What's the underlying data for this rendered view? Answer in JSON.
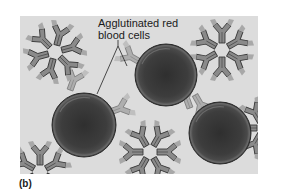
{
  "figure": {
    "panel_label": "(b)",
    "callout": {
      "line1": "Agglutinated red",
      "line2": "blood cells",
      "full_text": "Agglutinated red blood cells"
    },
    "colors": {
      "background_page": "#ffffff",
      "panel_background": "#dcdcdc",
      "antibody_body": "#8a8a8a",
      "antibody_outline": "#3a3a3a",
      "antibody_tip": "#a8a8a8",
      "rbc_fill": "#3d3d3d",
      "rbc_rim": "#555555",
      "leader_line": "#222222"
    },
    "red_blood_cells": [
      {
        "name": "left",
        "cx": 84,
        "cy": 125,
        "r": 32
      },
      {
        "name": "top-middle",
        "cx": 166,
        "cy": 75,
        "r": 31
      },
      {
        "name": "right",
        "cx": 220,
        "cy": 133,
        "r": 31
      }
    ],
    "antibody_clusters": [
      {
        "name": "top-left",
        "cx": 55,
        "cy": 52
      },
      {
        "name": "top-right",
        "cx": 222,
        "cy": 50
      },
      {
        "name": "bottom-middle",
        "cx": 150,
        "cy": 152
      },
      {
        "name": "bottom-left",
        "cx": 40,
        "cy": 170
      },
      {
        "name": "right-edge",
        "cx": 262,
        "cy": 128
      }
    ]
  }
}
